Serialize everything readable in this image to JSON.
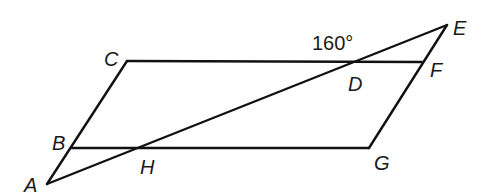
{
  "diagram": {
    "type": "geometry",
    "points": {
      "A": {
        "x": 47,
        "y": 184,
        "label": "A",
        "lx": 24,
        "ly": 192
      },
      "B": {
        "x": 72,
        "y": 148,
        "label": "B",
        "lx": 52,
        "ly": 150
      },
      "C": {
        "x": 127,
        "y": 61,
        "label": "C",
        "lx": 104,
        "ly": 66
      },
      "D": {
        "x": 355,
        "y": 61,
        "label": "D",
        "lx": 348,
        "ly": 91
      },
      "E": {
        "x": 447,
        "y": 25,
        "label": "E",
        "lx": 453,
        "ly": 35
      },
      "F": {
        "x": 422,
        "y": 62,
        "label": "F",
        "lx": 430,
        "ly": 77
      },
      "G": {
        "x": 369,
        "y": 148,
        "label": "G",
        "lx": 374,
        "ly": 170
      },
      "H": {
        "x": 138,
        "y": 148,
        "label": "H",
        "lx": 140,
        "ly": 174
      }
    },
    "segments": [
      {
        "from": "A",
        "to": "C",
        "name": "line-ac"
      },
      {
        "from": "C",
        "to": "F",
        "name": "line-cf"
      },
      {
        "from": "B",
        "to": "G",
        "name": "line-bg"
      },
      {
        "from": "G",
        "to": "E",
        "name": "line-ge"
      },
      {
        "from": "A",
        "to": "E",
        "name": "line-ae"
      }
    ],
    "angle_labels": [
      {
        "text": "160°",
        "x": 312,
        "y": 50,
        "at": "D"
      }
    ]
  }
}
